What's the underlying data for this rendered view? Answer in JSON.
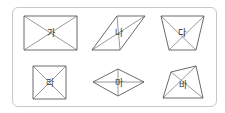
{
  "figures": [
    {
      "id": "ga",
      "label": "가",
      "type": "rectangle",
      "points": [
        [
          24,
          16
        ],
        [
          77,
          16
        ],
        [
          77,
          50
        ],
        [
          24,
          50
        ]
      ],
      "label_pos": [
        51,
        36
      ]
    },
    {
      "id": "na",
      "label": "나",
      "type": "parallelogram",
      "points": [
        [
          117,
          16
        ],
        [
          145,
          16
        ],
        [
          120,
          50
        ],
        [
          92,
          50
        ]
      ],
      "label_pos": [
        119,
        36
      ]
    },
    {
      "id": "da",
      "label": "다",
      "type": "trapezoid",
      "points": [
        [
          161,
          16
        ],
        [
          204,
          16
        ],
        [
          196,
          50
        ],
        [
          169,
          50
        ]
      ],
      "label_pos": [
        182,
        36
      ]
    },
    {
      "id": "ra",
      "label": "라",
      "type": "square",
      "points": [
        [
          33,
          66
        ],
        [
          66,
          66
        ],
        [
          66,
          99
        ],
        [
          33,
          99
        ]
      ],
      "label_pos": [
        50,
        86
      ]
    },
    {
      "id": "ma",
      "label": "마",
      "type": "rhombus",
      "points": [
        [
          118,
          69
        ],
        [
          144,
          82
        ],
        [
          118,
          96
        ],
        [
          93,
          82
        ]
      ],
      "label_pos": [
        119,
        86
      ]
    },
    {
      "id": "ba",
      "label": "바",
      "type": "quadrilateral",
      "points": [
        [
          171,
          72
        ],
        [
          196,
          66
        ],
        [
          203,
          98
        ],
        [
          163,
          98
        ]
      ],
      "label_pos": [
        183,
        88
      ]
    }
  ],
  "colors": {
    "stroke": "#444444",
    "border": "#c8c8c8"
  }
}
